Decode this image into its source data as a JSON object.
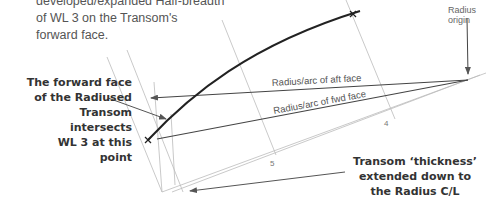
{
  "captions": {
    "top_line1": "developed/expanded Half-breadth",
    "top_line2": "of WL 3 on the Transom's",
    "top_line3": "forward face."
  },
  "callouts": {
    "forward_face_line1": "The forward face",
    "forward_face_line2": "of the Radiused",
    "forward_face_line3": "Transom intersects",
    "forward_face_line4": "WL 3 at this point",
    "thickness_line1": "Transom ‘thickness’",
    "thickness_line2": "extended down to",
    "thickness_line3": "the Radius C/L"
  },
  "labels": {
    "radius_origin": "Radius origin",
    "aft_face": "Radius/arc of aft face",
    "fwd_face": "Radius/arc of fwd face",
    "station_4": "4",
    "station_5": "5"
  },
  "colors": {
    "background": "#ffffff",
    "guide_line": "#bbbbbb",
    "radius_line": "#444444",
    "curve": "#222222",
    "text": "#333333"
  }
}
